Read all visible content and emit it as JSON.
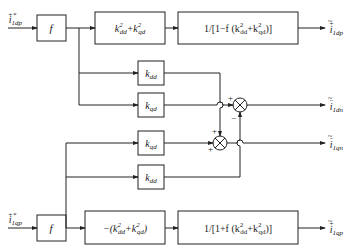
{
  "diagram": {
    "inputs": {
      "top": {
        "label": "i",
        "sub": "1dp",
        "sup": "+*"
      },
      "bottom": {
        "label": "i",
        "sub": "1qp",
        "sup": "+*"
      }
    },
    "outputs": {
      "dp": {
        "label": "i",
        "sub": "1dp",
        "sup": "+",
        "accent": "~"
      },
      "dn": {
        "label": "i",
        "sub": "1dn",
        "sup": "−",
        "accent": "~"
      },
      "qn": {
        "label": "i",
        "sub": "1qn",
        "sup": "−",
        "accent": "~"
      },
      "qp": {
        "label": "i",
        "sub": "1qp",
        "sup": "+",
        "accent": "~"
      }
    },
    "blocks": {
      "f_top": "f",
      "f_bottom": "f",
      "gain_top": {
        "pre": "k",
        "a_sub": "dd",
        "mid": "+k",
        "b_sub": "qd",
        "sup": "2"
      },
      "gain_bottom": {
        "pre": "−(k",
        "a_sub": "dd",
        "mid": "+k",
        "b_sub": "qd",
        "post": ")",
        "sup": "2"
      },
      "tf_top": {
        "pre": "1/[1−f (k",
        "a_sub": "dd",
        "mid": "+k",
        "b_sub": "qd",
        "post": ")]",
        "sup": "2"
      },
      "tf_bottom": {
        "pre": "1/[1+f (k",
        "a_sub": "dd",
        "mid": "+k",
        "b_sub": "qd",
        "post": ")]",
        "sup": "2"
      },
      "k1": {
        "k": "k",
        "sub": "dd"
      },
      "k2": {
        "k": "k",
        "sub": "qd"
      },
      "k3": {
        "k": "k",
        "sub": "qd"
      },
      "k4": {
        "k": "k",
        "sub": "dd"
      }
    },
    "summers": {
      "upper": {
        "in_left": "+",
        "in_bottom": "−"
      },
      "lower": {
        "in_top": "+",
        "in_left": "+"
      }
    },
    "colors": {
      "line": "#222222",
      "background": "#ffffff"
    }
  }
}
